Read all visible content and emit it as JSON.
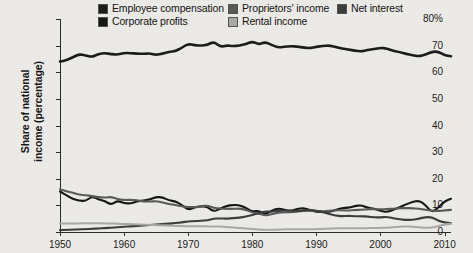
{
  "axis": {
    "y_title_line1": "Share of national",
    "y_title_line2": "income (percentage)",
    "y_ticks": [
      "80%",
      "70",
      "60",
      "50",
      "40",
      "30",
      "20",
      "10",
      "0"
    ],
    "x_ticks": [
      "1950",
      "1960",
      "1970",
      "1980",
      "1990",
      "2000",
      "2010"
    ]
  },
  "legend": {
    "items": [
      {
        "label": "Employee compensation",
        "color": "#1c1c1c",
        "swatch_name": "legend-swatch-employee-compensation"
      },
      {
        "label": "Corporate profits",
        "color": "#161616",
        "swatch_name": "legend-swatch-corporate-profits"
      },
      {
        "label": "Proprietors' income",
        "color": "#5a5a5a",
        "swatch_name": "legend-swatch-proprietors-income"
      },
      {
        "label": "Rental income",
        "color": "#a9a9a9",
        "swatch_name": "legend-swatch-rental-income"
      },
      {
        "label": "Net interest",
        "color": "#3d3d3d",
        "swatch_name": "legend-swatch-net-interest"
      }
    ]
  },
  "chart_data": {
    "type": "line",
    "title": "",
    "subtitle": "",
    "xlabel": "",
    "ylabel": "Share of national income (percentage)",
    "xlim": [
      1950,
      2011
    ],
    "ylim": [
      0,
      80
    ],
    "ytick_values": [
      0,
      10,
      20,
      30,
      40,
      50,
      60,
      70,
      80
    ],
    "xtick_values": [
      1950,
      1960,
      1970,
      1980,
      1990,
      2000,
      2010
    ],
    "grid": false,
    "legend_position": "top",
    "x": [
      1950,
      1951,
      1952,
      1953,
      1954,
      1955,
      1956,
      1957,
      1958,
      1959,
      1960,
      1961,
      1962,
      1963,
      1964,
      1965,
      1966,
      1967,
      1968,
      1969,
      1970,
      1971,
      1972,
      1973,
      1974,
      1975,
      1976,
      1977,
      1978,
      1979,
      1980,
      1981,
      1982,
      1983,
      1984,
      1985,
      1986,
      1987,
      1988,
      1989,
      1990,
      1991,
      1992,
      1993,
      1994,
      1995,
      1996,
      1997,
      1998,
      1999,
      2000,
      2001,
      2002,
      2003,
      2004,
      2005,
      2006,
      2007,
      2008,
      2009,
      2010,
      2011
    ],
    "series": [
      {
        "name": "Employee compensation",
        "color": "#1c1c1c",
        "width": 2.6,
        "values": [
          64.0,
          64.5,
          65.6,
          66.8,
          66.3,
          65.7,
          66.9,
          67.2,
          66.8,
          66.6,
          67.3,
          67.2,
          67.0,
          66.9,
          67.1,
          66.5,
          67.0,
          67.7,
          67.9,
          69.2,
          70.7,
          70.1,
          70.0,
          70.3,
          71.5,
          69.5,
          70.1,
          69.8,
          70.0,
          70.6,
          71.6,
          70.4,
          71.4,
          70.3,
          69.3,
          69.5,
          69.8,
          69.6,
          69.3,
          69.0,
          69.6,
          69.8,
          70.1,
          69.5,
          68.9,
          68.5,
          68.1,
          67.8,
          68.4,
          68.7,
          69.2,
          68.9,
          68.0,
          67.6,
          66.9,
          66.4,
          66.0,
          66.6,
          67.7,
          67.8,
          66.4,
          66.0
        ]
      },
      {
        "name": "Corporate profits",
        "color": "#161616",
        "width": 2.1,
        "values": [
          15.2,
          13.8,
          12.4,
          11.8,
          11.6,
          13.4,
          12.2,
          11.6,
          10.2,
          11.8,
          10.8,
          10.7,
          11.5,
          11.8,
          12.2,
          13.2,
          13.0,
          11.9,
          11.5,
          10.2,
          8.3,
          9.2,
          9.7,
          9.4,
          7.6,
          8.8,
          9.8,
          10.2,
          10.1,
          9.1,
          7.6,
          8.1,
          6.6,
          8.0,
          8.9,
          8.4,
          7.8,
          8.7,
          9.0,
          8.2,
          7.6,
          7.5,
          7.6,
          8.2,
          9.0,
          9.1,
          9.7,
          10.1,
          9.0,
          8.8,
          8.0,
          7.4,
          8.3,
          9.3,
          10.4,
          11.3,
          11.8,
          10.2,
          7.3,
          9.1,
          11.6,
          12.5
        ]
      },
      {
        "name": "Proprietors' income",
        "color": "#5a5a5a",
        "width": 2.1,
        "values": [
          16.0,
          15.3,
          14.7,
          14.0,
          13.8,
          13.5,
          13.1,
          12.9,
          13.2,
          12.3,
          12.0,
          12.1,
          11.9,
          11.5,
          11.4,
          11.6,
          11.1,
          10.5,
          10.1,
          9.6,
          9.4,
          9.3,
          9.6,
          10.0,
          9.0,
          8.8,
          8.7,
          8.7,
          8.8,
          8.4,
          7.3,
          6.9,
          6.2,
          6.6,
          7.3,
          7.4,
          7.4,
          7.7,
          8.0,
          8.0,
          7.9,
          7.7,
          8.1,
          8.1,
          8.2,
          8.0,
          8.3,
          8.3,
          8.6,
          8.6,
          8.5,
          8.6,
          8.8,
          8.9,
          9.0,
          8.9,
          8.7,
          8.4,
          8.0,
          7.9,
          8.1,
          8.3
        ]
      },
      {
        "name": "Net interest",
        "color": "#3d3d3d",
        "width": 2.1,
        "values": [
          0.7,
          0.8,
          0.9,
          1.0,
          1.1,
          1.2,
          1.3,
          1.5,
          1.6,
          1.8,
          2.0,
          2.1,
          2.3,
          2.5,
          2.7,
          2.8,
          3.0,
          3.2,
          3.3,
          3.6,
          4.0,
          4.1,
          4.2,
          4.4,
          5.0,
          5.1,
          5.0,
          5.2,
          5.4,
          5.8,
          6.4,
          7.1,
          7.8,
          7.6,
          8.0,
          8.0,
          8.1,
          7.9,
          8.0,
          8.3,
          8.0,
          7.5,
          6.8,
          6.2,
          5.9,
          6.1,
          5.9,
          5.9,
          5.8,
          5.5,
          5.5,
          5.7,
          5.2,
          4.8,
          4.5,
          4.6,
          5.0,
          5.6,
          5.6,
          4.2,
          3.6,
          3.3
        ]
      },
      {
        "name": "Rental income",
        "color": "#a9a9a9",
        "width": 2.0,
        "values": [
          3.2,
          3.2,
          3.2,
          3.2,
          3.3,
          3.3,
          3.3,
          3.2,
          3.2,
          3.1,
          3.0,
          3.0,
          2.9,
          2.8,
          2.7,
          2.6,
          2.5,
          2.4,
          2.3,
          2.2,
          2.1,
          2.2,
          2.2,
          2.1,
          2.0,
          2.1,
          1.9,
          1.7,
          1.5,
          1.3,
          1.1,
          0.9,
          0.8,
          0.8,
          0.9,
          1.0,
          1.0,
          1.0,
          1.0,
          1.0,
          1.1,
          1.2,
          1.3,
          1.4,
          1.4,
          1.4,
          1.4,
          1.4,
          1.5,
          1.5,
          1.5,
          1.6,
          1.8,
          2.0,
          2.1,
          2.0,
          1.8,
          1.6,
          1.6,
          2.2,
          2.8,
          3.1
        ]
      }
    ]
  }
}
